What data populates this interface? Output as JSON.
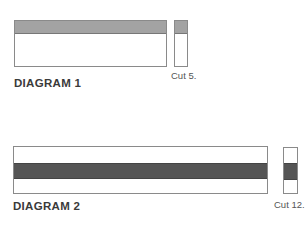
{
  "diagrams": [
    {
      "label": "DIAGRAM 1",
      "cut_label": "Cut 5.",
      "band_color": "#a3a3a3",
      "band_position": "top"
    },
    {
      "label": "DIAGRAM 2",
      "cut_label": "Cut 12.",
      "band_color": "#555555",
      "band_position": "middle"
    }
  ]
}
